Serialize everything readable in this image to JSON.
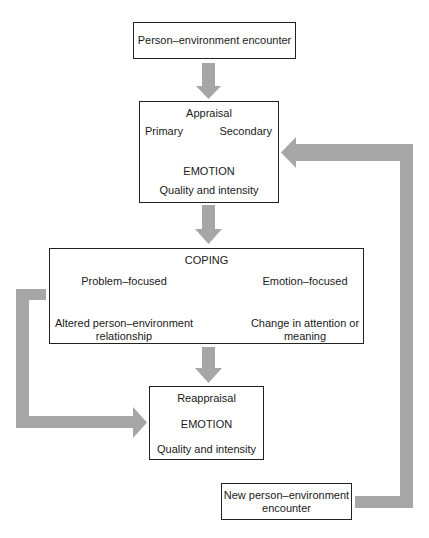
{
  "diagram": {
    "colors": {
      "arrow_fill": "#a6a6a6",
      "box_border": "#222222",
      "text": "#1a1a1a"
    },
    "nodes": {
      "encounter": {
        "label": "Person–environment encounter"
      },
      "appraisal": {
        "title": "Appraisal",
        "primary": "Primary",
        "secondary": "Secondary",
        "emotion": "EMOTION",
        "quality": "Quality and intensity"
      },
      "coping": {
        "title": "COPING",
        "problem_focused": "Problem–focused",
        "problem_outcome_line1": "Altered person–environment",
        "problem_outcome_line2": "relationship",
        "emotion_focused": "Emotion–focused",
        "emotion_outcome_line1": "Change in attention or",
        "emotion_outcome_line2": "meaning"
      },
      "reappraisal": {
        "title": "Reappraisal",
        "emotion": "EMOTION",
        "quality": "Quality and intensity"
      },
      "new_encounter": {
        "line1": "New person–environment",
        "line2": "encounter"
      }
    },
    "edges": [
      {
        "from": "encounter",
        "to": "appraisal",
        "style": "thick-gray-arrow"
      },
      {
        "from": "appraisal.primary",
        "to": "appraisal.emotion",
        "style": "thin-elbow-arrow"
      },
      {
        "from": "appraisal.secondary",
        "to": "appraisal.emotion",
        "style": "thin-elbow-arrow"
      },
      {
        "from": "appraisal",
        "to": "coping",
        "style": "thick-gray-arrow"
      },
      {
        "from": "coping.problem_focused",
        "to": "coping.problem_outcome",
        "style": "thin-arrow"
      },
      {
        "from": "coping.emotion_focused",
        "to": "coping.emotion_outcome",
        "style": "thin-arrow"
      },
      {
        "from": "coping",
        "to": "reappraisal",
        "style": "thick-gray-arrow"
      },
      {
        "from": "coping",
        "to": "reappraisal",
        "style": "thick-gray-elbow-left"
      },
      {
        "from": "new_encounter",
        "to": "appraisal",
        "style": "thick-gray-elbow-right"
      }
    ]
  }
}
